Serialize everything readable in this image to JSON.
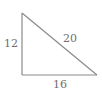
{
  "diagram": {
    "type": "right-triangle",
    "stroke_color": "#8a8a8a",
    "text_color": "#707070",
    "vertices": {
      "top": [
        22,
        13
      ],
      "bottom_left": [
        22,
        75
      ],
      "bottom_right": [
        97,
        75
      ]
    },
    "sides": {
      "vertical": {
        "label": "12"
      },
      "hypotenuse": {
        "label": "20"
      },
      "base": {
        "label": "16"
      }
    }
  }
}
